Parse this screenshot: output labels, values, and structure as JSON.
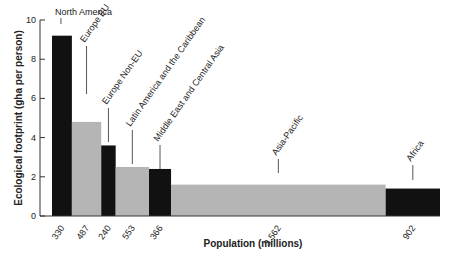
{
  "chart_data": {
    "type": "bar",
    "variant": "variable-width",
    "title": "",
    "xlabel": "Population (millions)",
    "ylabel": "Ecological footprint (gha per person)",
    "ylim": [
      0,
      10
    ],
    "yticks": [
      0,
      2,
      4,
      6,
      8,
      10
    ],
    "grid": false,
    "legend": null,
    "categories": [
      "North America",
      "Europe EU",
      "Europe Non-EU",
      "Latin America and the Caribbean",
      "Middle East and Central Asia",
      "Asia-Pacific",
      "Africa"
    ],
    "population_millions": [
      330,
      487,
      240,
      553,
      366,
      3562,
      902
    ],
    "population_labels": [
      "330",
      "487",
      "240",
      "553",
      "366",
      "3,562",
      "902"
    ],
    "values": [
      9.2,
      4.8,
      3.6,
      2.5,
      2.4,
      1.6,
      1.4
    ],
    "colors": [
      "#111111",
      "#b5b5b5",
      "#111111",
      "#b5b5b5",
      "#111111",
      "#b5b5b5",
      "#111111"
    ]
  }
}
